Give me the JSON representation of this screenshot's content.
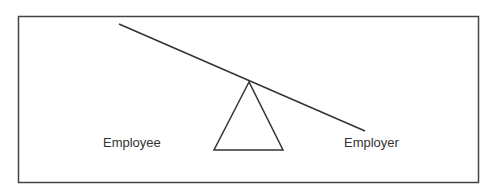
{
  "diagram": {
    "type": "seesaw-balance",
    "labels": {
      "left": "Employee",
      "right": "Employer"
    },
    "colors": {
      "stroke": "#333333",
      "background": "#ffffff",
      "text": "#333333"
    }
  }
}
